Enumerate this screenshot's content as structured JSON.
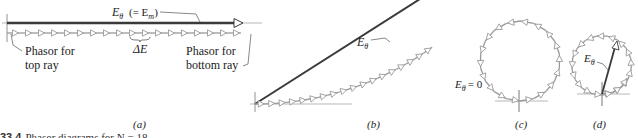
{
  "figure": {
    "caption_number": "33.4",
    "caption_text": "Phasor diagrams for N = 18",
    "colors": {
      "resultant": "#3a3a3a",
      "phasor": "#9a9a9a",
      "phasor_fill": "#ffffff",
      "axis": "#777777",
      "leader": "#555555"
    }
  },
  "panels": {
    "a": {
      "label": "(a)",
      "resultant_label": "Eθ (= Em)",
      "resultant_symbol": "E",
      "resultant_sub": "θ",
      "resultant_note": "(= E",
      "resultant_note_sub": "m",
      "resultant_note_close": ")",
      "delta_label": "ΔE",
      "phasor_top_label_line1": "Phasor for",
      "phasor_top_label_line2": "top ray",
      "phasor_bottom_label_line1": "Phasor for",
      "phasor_bottom_label_line2": "bottom ray",
      "phasor_count": 18
    },
    "b": {
      "label": "(b)",
      "resultant_symbol": "E",
      "resultant_sub": "θ",
      "phasor_count": 18
    },
    "c": {
      "label": "(c)",
      "zero_label_symbol": "E",
      "zero_label_sub": "θ",
      "zero_label_value": "= 0",
      "phasor_count": 18
    },
    "d": {
      "label": "(d)",
      "resultant_symbol": "E",
      "resultant_sub": "θ",
      "phasor_count": 20
    }
  }
}
